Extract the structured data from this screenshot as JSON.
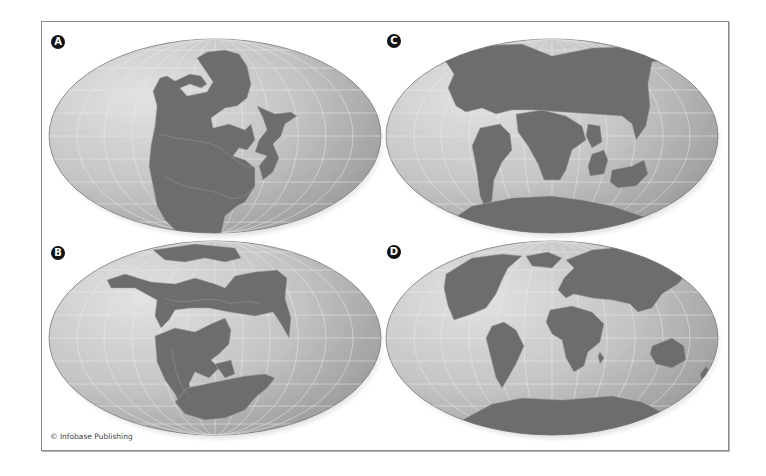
{
  "figure": {
    "credit": "© Infobase Publishing",
    "colors": {
      "ocean_light": "#dadada",
      "ocean_mid": "#bdbdbd",
      "ocean_dark": "#8c8c8c",
      "land": "#6d6d6d",
      "grid": "#eeeeee",
      "coast_line": "#a9a9a9"
    },
    "panels": [
      {
        "id": "A",
        "label": "A",
        "description": "Pangaea supercontinent"
      },
      {
        "id": "B",
        "label": "B",
        "description": "Laurasia and Gondwana separating"
      },
      {
        "id": "C",
        "label": "C",
        "description": "Continents breaking apart"
      },
      {
        "id": "D",
        "label": "D",
        "description": "Present-day continents"
      }
    ]
  }
}
